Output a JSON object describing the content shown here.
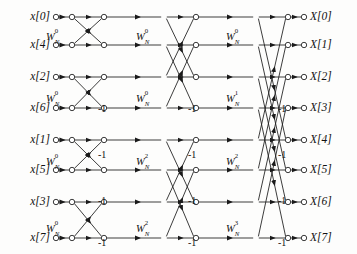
{
  "figure": {
    "type": "signal-flow-graph",
    "name": "8-point radix-2 decimation-in-time FFT butterfly diagram",
    "stages": 3,
    "points": 8,
    "line_color": "#1a1a1a",
    "node_fill": "#ffffff",
    "background": "#fdfdfc"
  },
  "inputs": [
    {
      "label": "x[0]",
      "index": 0,
      "y": 17
    },
    {
      "label": "x[4]",
      "index": 4,
      "y": 45
    },
    {
      "label": "x[2]",
      "index": 2,
      "y": 77
    },
    {
      "label": "x[6]",
      "index": 6,
      "y": 108
    },
    {
      "label": "x[1]",
      "index": 1,
      "y": 140
    },
    {
      "label": "x[5]",
      "index": 5,
      "y": 170
    },
    {
      "label": "x[3]",
      "index": 3,
      "y": 202
    },
    {
      "label": "x[7]",
      "index": 7,
      "y": 238
    }
  ],
  "outputs": [
    {
      "label": "X[0]",
      "index": 0,
      "y": 17
    },
    {
      "label": "X[1]",
      "index": 1,
      "y": 45
    },
    {
      "label": "X[2]",
      "index": 2,
      "y": 77
    },
    {
      "label": "X[3]",
      "index": 3,
      "y": 108
    },
    {
      "label": "X[4]",
      "index": 4,
      "y": 140
    },
    {
      "label": "X[5]",
      "index": 5,
      "y": 170
    },
    {
      "label": "X[6]",
      "index": 6,
      "y": 202
    },
    {
      "label": "X[7]",
      "index": 7,
      "y": 238
    }
  ],
  "twiddle_factors": {
    "symbol": "W",
    "subscript": "N",
    "stage1": [
      {
        "exponent": "0",
        "row": 1,
        "x": 46,
        "y": 32
      },
      {
        "exponent": "0",
        "row": 3,
        "x": 46,
        "y": 94
      },
      {
        "exponent": "0",
        "row": 5,
        "x": 46,
        "y": 157
      },
      {
        "exponent": "0",
        "row": 7,
        "x": 46,
        "y": 224
      }
    ],
    "stage2": [
      {
        "exponent": "0",
        "row": 1,
        "x": 136,
        "y": 32
      },
      {
        "exponent": "0",
        "row": 3,
        "x": 136,
        "y": 94
      },
      {
        "exponent": "2",
        "row": 5,
        "x": 136,
        "y": 157
      },
      {
        "exponent": "2",
        "row": 7,
        "x": 136,
        "y": 224
      }
    ],
    "stage3": [
      {
        "exponent": "0",
        "row": 1,
        "x": 226,
        "y": 32
      },
      {
        "exponent": "1",
        "row": 3,
        "x": 226,
        "y": 94
      },
      {
        "exponent": "2",
        "row": 5,
        "x": 226,
        "y": 157
      },
      {
        "exponent": "3",
        "row": 7,
        "x": 226,
        "y": 224
      }
    ]
  },
  "minus_one_labels": {
    "text": "-1",
    "stage1": [
      {
        "x": 98,
        "y": 104
      },
      {
        "x": 98,
        "y": 150
      },
      {
        "x": 98,
        "y": 196
      },
      {
        "x": 98,
        "y": 238
      }
    ],
    "stage2": [
      {
        "x": 188,
        "y": 104
      },
      {
        "x": 188,
        "y": 150
      },
      {
        "x": 188,
        "y": 196
      },
      {
        "x": 188,
        "y": 238
      }
    ],
    "stage3": [
      {
        "x": 278,
        "y": 104
      },
      {
        "x": 278,
        "y": 150
      },
      {
        "x": 278,
        "y": 196
      },
      {
        "x": 278,
        "y": 238
      }
    ]
  },
  "columns": {
    "input_nodes_x": 72,
    "stage1_out_x": 104,
    "stage2_in_x": 164,
    "stage2_out_x": 196,
    "stage3_in_x": 256,
    "stage3_out_x": 288,
    "input_terminal_x": 56,
    "output_terminal_x": 304
  }
}
